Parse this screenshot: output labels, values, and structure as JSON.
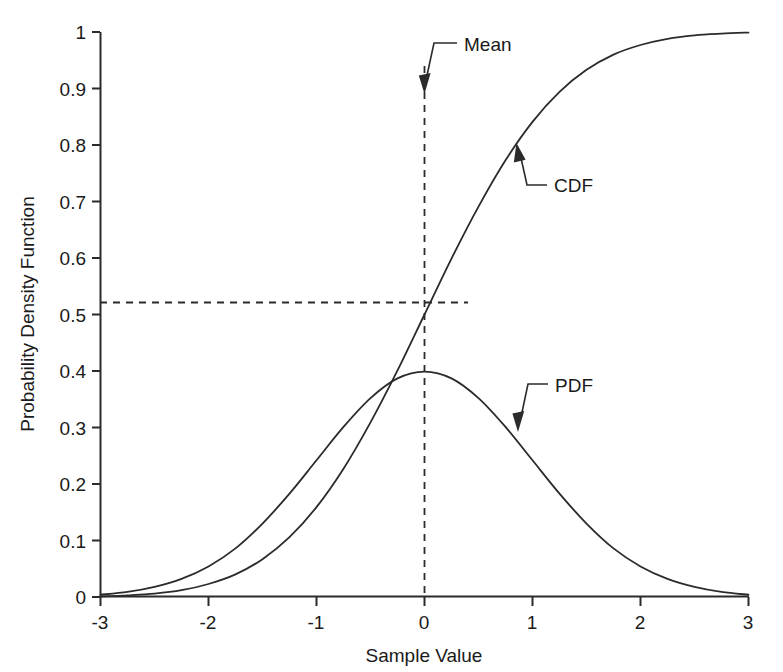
{
  "chart_data": {
    "type": "line",
    "title": "",
    "xlabel": "Sample Value",
    "ylabel": "Probability Density Function",
    "xlim": [
      -3,
      3
    ],
    "ylim": [
      0,
      1
    ],
    "grid": false,
    "legend_position": "none",
    "x_ticks": [
      "-3",
      "-2",
      "-1",
      "0",
      "1",
      "2",
      "3"
    ],
    "x_tick_values": [
      -3,
      -2,
      -1,
      0,
      1,
      2,
      3
    ],
    "y_ticks": [
      "0",
      "0.1",
      "0.2",
      "0.3",
      "0.4",
      "0.5",
      "0.6",
      "0.7",
      "0.8",
      "0.9",
      "1"
    ],
    "y_tick_values": [
      0,
      0.1,
      0.2,
      0.3,
      0.4,
      0.5,
      0.6,
      0.7,
      0.8,
      0.9,
      1.0
    ],
    "series": [
      {
        "name": "PDF",
        "description": "standard normal probability density function, mean 0, sd 1",
        "x": [
          -3,
          -2.75,
          -2.5,
          -2.25,
          -2,
          -1.75,
          -1.5,
          -1.25,
          -1,
          -0.75,
          -0.5,
          -0.25,
          0,
          0.25,
          0.5,
          0.75,
          1,
          1.25,
          1.5,
          1.75,
          2,
          2.25,
          2.5,
          2.75,
          3
        ],
        "values": [
          0.004,
          0.009,
          0.018,
          0.032,
          0.054,
          0.086,
          0.13,
          0.183,
          0.242,
          0.301,
          0.352,
          0.387,
          0.399,
          0.387,
          0.352,
          0.301,
          0.242,
          0.183,
          0.13,
          0.086,
          0.054,
          0.032,
          0.018,
          0.009,
          0.004
        ]
      },
      {
        "name": "CDF",
        "description": "standard normal cumulative distribution function, mean 0, sd 1",
        "x": [
          -3,
          -2.75,
          -2.5,
          -2.25,
          -2,
          -1.75,
          -1.5,
          -1.25,
          -1,
          -0.75,
          -0.5,
          -0.25,
          0,
          0.25,
          0.5,
          0.75,
          1,
          1.25,
          1.5,
          1.75,
          2,
          2.25,
          2.5,
          2.75,
          3
        ],
        "values": [
          0.001,
          0.003,
          0.006,
          0.012,
          0.023,
          0.04,
          0.067,
          0.106,
          0.159,
          0.227,
          0.309,
          0.401,
          0.5,
          0.599,
          0.691,
          0.773,
          0.841,
          0.894,
          0.933,
          0.96,
          0.977,
          0.988,
          0.994,
          0.997,
          0.999
        ]
      }
    ],
    "annotations": [
      {
        "id": "mean",
        "label": "Mean",
        "points_to": "vertical dashed line at Sample Value = 0"
      },
      {
        "id": "cdf",
        "label": "CDF",
        "points_to": "cumulative distribution function curve"
      },
      {
        "id": "pdf",
        "label": "PDF",
        "points_to": "probability density function curve"
      }
    ],
    "reference_lines": [
      {
        "id": "mean-vertical",
        "orientation": "vertical",
        "value": 0,
        "style": "dashed"
      },
      {
        "id": "cdf-level-horizontal",
        "orientation": "horizontal",
        "value": 0.52,
        "style": "dashed"
      }
    ]
  },
  "colors": {
    "ink": "#2b2b2b",
    "background": "#ffffff"
  }
}
